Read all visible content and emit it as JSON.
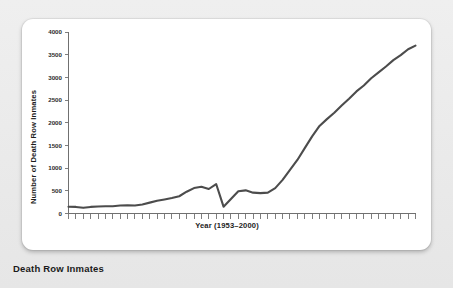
{
  "caption": "Death Row Inmates",
  "chart_data": {
    "type": "line",
    "title": "",
    "xlabel": "Year (1953–2000)",
    "ylabel": "Number of Death Row Inmates",
    "xlim": [
      1953,
      2000
    ],
    "ylim": [
      0,
      4000
    ],
    "grid": false,
    "legend": null,
    "line_color": "#4c4c4c",
    "yticks": [
      0,
      500,
      1000,
      1500,
      2000,
      2500,
      3000,
      3500,
      4000
    ],
    "ytick_labels": [
      "0",
      "500",
      "1000",
      "1500",
      "2000",
      "2500",
      "3000",
      "3500",
      "4000"
    ],
    "xtick_labels": [],
    "xtick_count": 48,
    "x": [
      1953,
      1954,
      1955,
      1956,
      1957,
      1958,
      1959,
      1960,
      1961,
      1962,
      1963,
      1964,
      1965,
      1966,
      1967,
      1968,
      1969,
      1970,
      1971,
      1972,
      1973,
      1974,
      1975,
      1976,
      1977,
      1978,
      1979,
      1980,
      1981,
      1982,
      1983,
      1984,
      1985,
      1986,
      1987,
      1988,
      1989,
      1990,
      1991,
      1992,
      1993,
      1994,
      1995,
      1996,
      1997,
      1998,
      1999,
      2000
    ],
    "values": [
      150,
      145,
      125,
      145,
      155,
      160,
      160,
      175,
      180,
      175,
      200,
      240,
      280,
      310,
      340,
      380,
      480,
      560,
      590,
      540,
      650,
      150,
      320,
      490,
      510,
      460,
      450,
      460,
      560,
      740,
      960,
      1180,
      1440,
      1700,
      1930,
      2080,
      2220,
      2380,
      2530,
      2690,
      2820,
      2980,
      3110,
      3240,
      3380,
      3490,
      3620,
      3700
    ],
    "annotations": []
  }
}
